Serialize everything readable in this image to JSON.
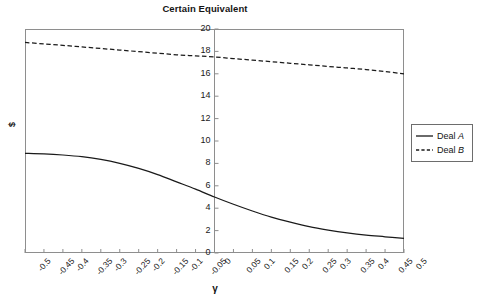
{
  "chart_data": {
    "type": "line",
    "title": "Certain Equivalent",
    "xlabel": "γ",
    "ylabel": "$",
    "xlim": [
      -0.5,
      0.5
    ],
    "ylim": [
      0,
      20
    ],
    "grid": false,
    "legend_position": "right",
    "x_tick_labels": [
      "-0.5",
      "-0.45",
      "-0.4",
      "-0.35",
      "-0.3",
      "-0.25",
      "-0.2",
      "-0.15",
      "-0.1",
      "-0.05",
      "0",
      "0.05",
      "0.1",
      "0.15",
      "0.2",
      "0.25",
      "0.3",
      "0.35",
      "0.4",
      "0.45",
      "0.5"
    ],
    "y_tick_labels": [
      "0",
      "2",
      "4",
      "6",
      "8",
      "10",
      "12",
      "14",
      "16",
      "18",
      "20"
    ],
    "x": [
      -0.5,
      -0.45,
      -0.4,
      -0.35,
      -0.3,
      -0.25,
      -0.2,
      -0.15,
      -0.1,
      -0.05,
      0,
      0.05,
      0.1,
      0.15,
      0.2,
      0.25,
      0.3,
      0.35,
      0.4,
      0.45,
      0.5
    ],
    "series": [
      {
        "name": "Deal A",
        "style": "solid",
        "color": "#1a1a1a",
        "values": [
          8.9,
          8.85,
          8.75,
          8.6,
          8.35,
          8.0,
          7.55,
          7.0,
          6.35,
          5.7,
          5.0,
          4.35,
          3.75,
          3.2,
          2.75,
          2.35,
          2.05,
          1.8,
          1.6,
          1.45,
          1.3
        ]
      },
      {
        "name": "Deal B",
        "style": "dashed",
        "color": "#1a1a1a",
        "values": [
          18.8,
          18.67,
          18.54,
          18.4,
          18.26,
          18.12,
          17.98,
          17.84,
          17.7,
          17.6,
          17.5,
          17.36,
          17.22,
          17.08,
          16.94,
          16.8,
          16.66,
          16.52,
          16.38,
          16.2,
          16.0
        ]
      }
    ]
  },
  "legend": {
    "items": [
      {
        "label_prefix": "Deal ",
        "label_italic": "A",
        "style": "solid"
      },
      {
        "label_prefix": "Deal ",
        "label_italic": "B",
        "style": "dashed"
      }
    ]
  }
}
